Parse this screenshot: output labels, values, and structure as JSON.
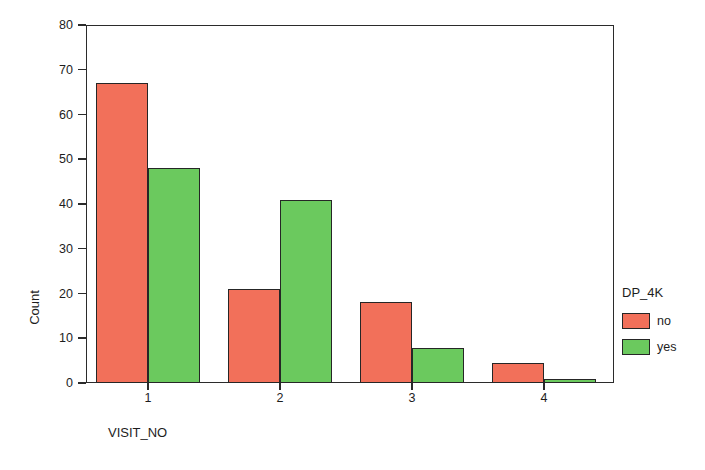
{
  "chart_data": {
    "type": "bar",
    "title": "",
    "xlabel": "VISIT_NO",
    "ylabel": "Count",
    "categories": [
      "1",
      "2",
      "3",
      "4"
    ],
    "series": [
      {
        "name": "no",
        "color": "#F2705A",
        "values": [
          67,
          21,
          18,
          4.5
        ]
      },
      {
        "name": "yes",
        "color": "#6BC95E",
        "values": [
          48,
          41,
          7.8,
          1
        ]
      }
    ],
    "legend": {
      "title": "DP_4K",
      "position": "right",
      "entries": [
        {
          "label": "no",
          "color": "#F2705A"
        },
        {
          "label": "yes",
          "color": "#6BC95E"
        }
      ]
    },
    "ylim": [
      0,
      80
    ],
    "yticks": [
      0,
      10,
      20,
      30,
      40,
      50,
      60,
      70,
      80
    ],
    "ytick_labels": [
      "0",
      "10",
      "20",
      "30",
      "40",
      "50",
      "60",
      "70",
      "80"
    ],
    "grid": false,
    "frame": true
  },
  "axes": {
    "y_title": "Count",
    "x_title": "VISIT_NO"
  }
}
